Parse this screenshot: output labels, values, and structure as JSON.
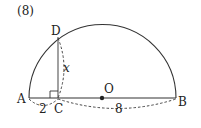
{
  "problem_number": "(8)",
  "points": {
    "A": {
      "label": "A"
    },
    "B": {
      "label": "B"
    },
    "C": {
      "label": "C"
    },
    "D": {
      "label": "D"
    },
    "O": {
      "label": "O"
    }
  },
  "measurements": {
    "AC": "2",
    "CB": "8",
    "DC": "x"
  },
  "colors": {
    "stroke": "#333333",
    "text": "#222222"
  }
}
